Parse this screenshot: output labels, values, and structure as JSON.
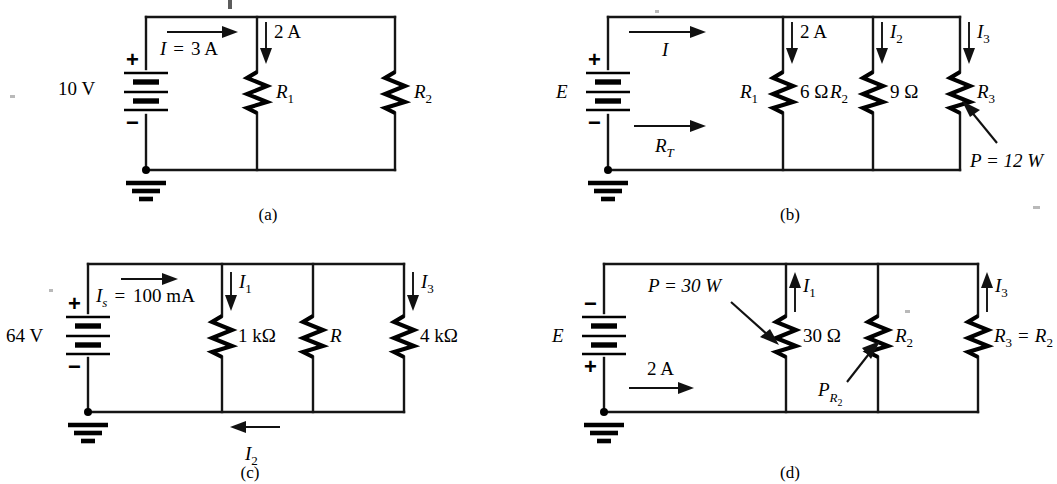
{
  "figure": {
    "panel_count": 4
  },
  "panels": [
    {
      "id": "a",
      "caption": "(a)",
      "source": {
        "type": "battery",
        "value": "10 V",
        "plus": "+",
        "minus": "−"
      },
      "labels": {
        "source_current": "I",
        "source_current_eq": "=",
        "source_current_value": "3 A",
        "branch1_current": "2 A"
      },
      "resistors": [
        {
          "name": "R",
          "sub": "1",
          "value": ""
        },
        {
          "name": "R",
          "sub": "2",
          "value": ""
        }
      ]
    },
    {
      "id": "b",
      "caption": "(b)",
      "source": {
        "type": "battery",
        "value": "E",
        "plus": "+",
        "minus": "−"
      },
      "labels": {
        "source_current": "I",
        "total_resistance": "R",
        "total_resistance_sub": "T",
        "branch1_current": "2 A",
        "branch2_current": "I",
        "branch2_current_sub": "2",
        "branch3_current": "I",
        "branch3_current_sub": "3",
        "power_note": "P  =  12 W"
      },
      "resistors": [
        {
          "name": "R",
          "sub": "1",
          "value": "6 Ω"
        },
        {
          "name": "R",
          "sub": "2",
          "value": "9 Ω"
        },
        {
          "name": "R",
          "sub": "3",
          "value": ""
        }
      ]
    },
    {
      "id": "c",
      "caption": "(c)",
      "source": {
        "type": "battery",
        "value": "64 V",
        "plus": "+",
        "minus": "−"
      },
      "labels": {
        "source_current": "I",
        "source_current_sub": "s",
        "source_current_eq": "=",
        "source_current_value": "100 mA",
        "branch1_current": "I",
        "branch1_current_sub": "1",
        "branch2_current": "I",
        "branch2_current_sub": "2",
        "branch3_current": "I",
        "branch3_current_sub": "3"
      },
      "resistors": [
        {
          "name": "",
          "sub": "",
          "value": "1 kΩ"
        },
        {
          "name": "R",
          "sub": "",
          "value": ""
        },
        {
          "name": "",
          "sub": "",
          "value": "4 kΩ"
        }
      ]
    },
    {
      "id": "d",
      "caption": "(d)",
      "source": {
        "type": "battery",
        "value": "E",
        "plus": "+",
        "minus": "−"
      },
      "labels": {
        "power_note": "P  =  30 W",
        "source_current_value": "2 A",
        "branch1_current": "I",
        "branch1_current_sub": "1",
        "branch3_current": "I",
        "branch3_current_sub": "3",
        "power_r2": "P",
        "power_r2_sub": "R",
        "power_r2_sub2": "2"
      },
      "resistors": [
        {
          "name": "",
          "sub": "",
          "value": "30 Ω"
        },
        {
          "name": "R",
          "sub": "2",
          "value": ""
        },
        {
          "name": "R",
          "sub": "3",
          "value": "",
          "equals": "=",
          "equals_to": "R",
          "equals_to_sub": "2"
        }
      ]
    }
  ],
  "colors": {
    "ink": "#151515",
    "background": "#ffffff"
  }
}
